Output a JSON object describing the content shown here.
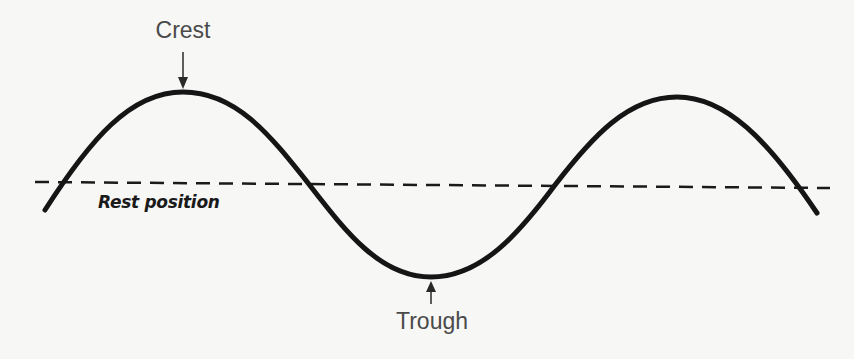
{
  "diagram": {
    "labels": {
      "crest": "Crest",
      "trough": "Trough",
      "rest_position": "Rest position"
    },
    "colors": {
      "background": "#f7f7f6",
      "wave": "#151515",
      "rest_line": "#1a1a1a",
      "label_text": "#4a4a4a"
    },
    "wave": {
      "points": [
        [
          45,
          210
        ],
        [
          183,
          92
        ],
        [
          308,
          183
        ],
        [
          431,
          277
        ],
        [
          555,
          185
        ],
        [
          677,
          97
        ],
        [
          817,
          213
        ]
      ],
      "stroke_width": 5
    },
    "rest_line": {
      "x1": 35,
      "y1": 182,
      "x2": 830,
      "y2": 188,
      "dash": "14 9",
      "stroke_width": 2.5
    },
    "arrows": {
      "crest": {
        "x": 183,
        "y_from": 52,
        "y_to": 88
      },
      "trough": {
        "x": 431,
        "y_from": 304,
        "y_to": 281
      }
    }
  }
}
